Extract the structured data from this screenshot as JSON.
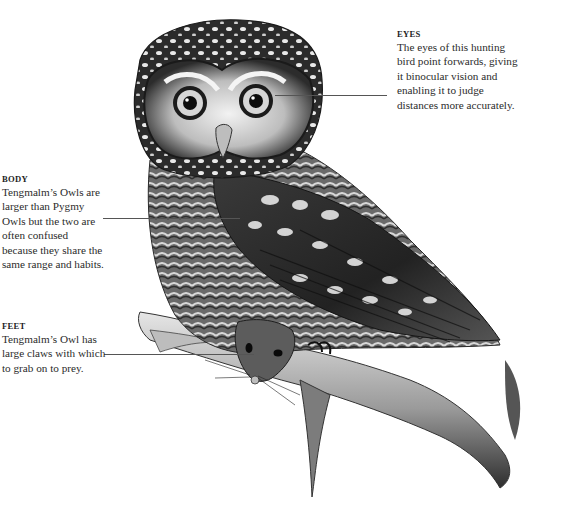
{
  "callouts": {
    "eyes": {
      "heading": "EYES",
      "lines": [
        "The eyes of this hunting",
        "bird point forwards, giving",
        "it binocular vision and",
        "enabling it to judge",
        "distances more accurately."
      ]
    },
    "body": {
      "heading": "BODY",
      "lines": [
        "Tengmalm’s Owls are",
        "larger than Pygmy",
        "Owls but the two are",
        "often confused",
        "because they share the",
        "same range and habits."
      ]
    },
    "feet": {
      "heading": "FEET",
      "lines": [
        "Tengmalm’s Owl has",
        "large claws with which",
        "to grab on to prey."
      ]
    }
  },
  "illustration": {
    "subject": "Tengmalm's Owl perched on a branch holding a mouse",
    "style": "monochrome pencil drawing",
    "colors": {
      "ink": "#1c1c1c",
      "mid": "#6e6e6e",
      "light": "#d8d8d8",
      "leader": "#555555"
    }
  }
}
